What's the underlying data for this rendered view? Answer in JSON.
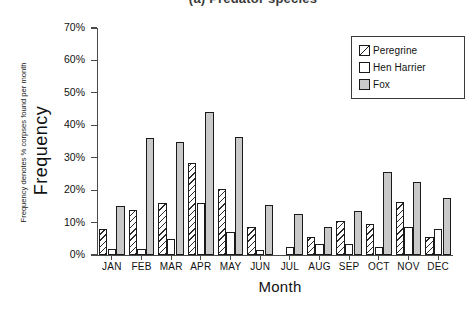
{
  "caption": "(a) Predator species",
  "chart_data": {
    "type": "bar",
    "title": "(a) Predator species",
    "xlabel": "Month",
    "ylabel": "Frequency",
    "ylabel_note": "Frequency denotes % corpses found per month",
    "ylim": [
      0,
      70
    ],
    "ytick_labels": [
      "0%",
      "10%",
      "20%",
      "30%",
      "40%",
      "50%",
      "60%",
      "70%"
    ],
    "ytick_values": [
      0,
      10,
      20,
      30,
      40,
      50,
      60,
      70
    ],
    "grid": false,
    "legend_position": "top-right",
    "categories": [
      "JAN",
      "FEB",
      "MAR",
      "APR",
      "MAY",
      "JUN",
      "JUL",
      "AUG",
      "SEP",
      "OCT",
      "NOV",
      "DEC"
    ],
    "series": [
      {
        "name": "Peregrine",
        "pattern": "diagonal-hatch",
        "color": "#ffffff",
        "values": [
          8.0,
          14.0,
          16.0,
          28.5,
          20.5,
          8.5,
          0.0,
          5.5,
          10.5,
          9.5,
          16.5,
          5.5
        ]
      },
      {
        "name": "Hen Harrier",
        "pattern": "solid-white",
        "color": "#ffffff",
        "values": [
          2.0,
          2.0,
          5.0,
          16.0,
          7.0,
          1.5,
          2.5,
          3.5,
          3.5,
          2.5,
          8.5,
          8.0
        ]
      },
      {
        "name": "Fox",
        "pattern": "solid-gray",
        "color": "#c9c9c9",
        "values": [
          15.0,
          36.0,
          35.0,
          44.0,
          36.5,
          15.5,
          12.5,
          8.5,
          13.5,
          25.5,
          22.5,
          17.5
        ]
      }
    ]
  },
  "legend": {
    "items": [
      {
        "label": "Peregrine"
      },
      {
        "label": "Hen Harrier"
      },
      {
        "label": "Fox"
      }
    ]
  }
}
